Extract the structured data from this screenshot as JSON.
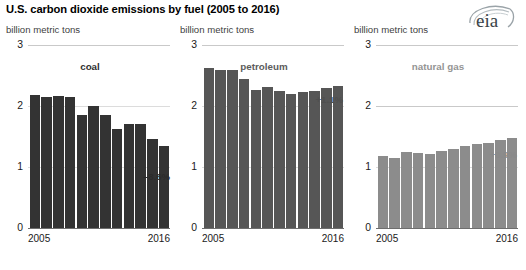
{
  "header": {
    "title": "U.S. carbon dioxide emissions by fuel (2005 to 2016)",
    "logo_text": "eia",
    "logo_name": "eia-logo"
  },
  "panels": [
    {
      "key": "coal",
      "units": "billion metric tons",
      "series_label": "coal",
      "pct_change": "–8.6%",
      "color": "#333333",
      "y_ticks": [
        "3",
        "2",
        "1",
        "0"
      ],
      "x_start": "2005",
      "x_end": "2016"
    },
    {
      "key": "petroleum",
      "units": "billion metric tons",
      "series_label": "petroleum",
      "pct_change": "+1.1%",
      "color": "#565656",
      "y_ticks": [
        "3",
        "2",
        "1",
        "0"
      ],
      "x_start": "2005",
      "x_end": "2016"
    },
    {
      "key": "natural_gas",
      "units": "billion metric tons",
      "series_label": "natural gas",
      "pct_change": "+0.9%",
      "color": "#8c8c8c",
      "y_ticks": [
        "3",
        "2",
        "1",
        "0"
      ],
      "x_start": "2005",
      "x_end": "2016"
    }
  ],
  "chart_data": [
    {
      "type": "bar",
      "title": "coal",
      "xlabel": "",
      "ylabel": "billion metric tons",
      "ylim": [
        0,
        3
      ],
      "yticks": [
        0,
        1,
        2,
        3
      ],
      "grid": true,
      "legend": "none",
      "annotation": "–8.6%",
      "categories": [
        "2005",
        "2006",
        "2007",
        "2008",
        "2009",
        "2010",
        "2011",
        "2012",
        "2013",
        "2014",
        "2015",
        "2016"
      ],
      "values": [
        2.18,
        2.14,
        2.17,
        2.14,
        1.86,
        2.0,
        1.86,
        1.63,
        1.7,
        1.7,
        1.46,
        1.34
      ]
    },
    {
      "type": "bar",
      "title": "petroleum",
      "xlabel": "",
      "ylabel": "billion metric tons",
      "ylim": [
        0,
        3
      ],
      "yticks": [
        0,
        1,
        2,
        3
      ],
      "grid": true,
      "legend": "none",
      "annotation": "+1.1%",
      "categories": [
        "2005",
        "2006",
        "2007",
        "2008",
        "2009",
        "2010",
        "2011",
        "2012",
        "2013",
        "2014",
        "2015",
        "2016"
      ],
      "values": [
        2.62,
        2.59,
        2.59,
        2.44,
        2.27,
        2.31,
        2.25,
        2.19,
        2.23,
        2.24,
        2.3,
        2.32
      ]
    },
    {
      "type": "bar",
      "title": "natural gas",
      "xlabel": "",
      "ylabel": "billion metric tons",
      "ylim": [
        0,
        3
      ],
      "yticks": [
        0,
        1,
        2,
        3
      ],
      "grid": true,
      "legend": "none",
      "annotation": "+0.9%",
      "categories": [
        "2005",
        "2006",
        "2007",
        "2008",
        "2009",
        "2010",
        "2011",
        "2012",
        "2013",
        "2014",
        "2015",
        "2016"
      ],
      "values": [
        1.18,
        1.15,
        1.24,
        1.23,
        1.21,
        1.27,
        1.29,
        1.34,
        1.37,
        1.4,
        1.45,
        1.48
      ]
    }
  ]
}
